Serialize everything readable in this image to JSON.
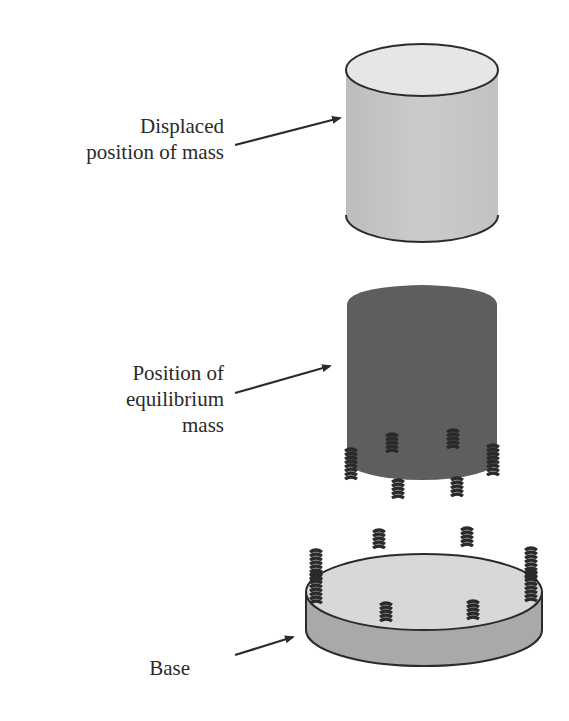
{
  "labels": {
    "displaced": [
      "Displaced",
      "position of mass"
    ],
    "equilibrium": [
      "Position of",
      "equilibrium",
      "mass"
    ],
    "base": "Base"
  },
  "colors": {
    "displaced_mass_top": "#e6e6e6",
    "displaced_mass_body": "#c4c4c4",
    "equilibrium_mass": "#5e5e5e",
    "base_top": "#d8d8d8",
    "base_side": "#a9a9a9",
    "outline": "#2b2b2b",
    "spring": "#2a2a2a"
  },
  "components": [
    {
      "name": "displaced-mass",
      "shape": "cylinder"
    },
    {
      "name": "equilibrium-mass",
      "shape": "cylinder",
      "springs": 8
    },
    {
      "name": "base",
      "shape": "disc",
      "springs": 8
    }
  ]
}
